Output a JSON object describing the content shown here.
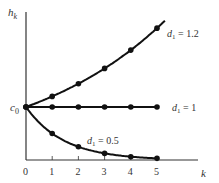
{
  "chart_data": {
    "type": "line",
    "title": "",
    "xlabel": "k",
    "ylabel": "h_k",
    "x": [
      0,
      1,
      2,
      3,
      4,
      5
    ],
    "x_tick_labels": [
      "0",
      "1",
      "2",
      "3",
      "4",
      "5"
    ],
    "y_tick_labels": [
      "c0"
    ],
    "y_reference": {
      "label": "c0",
      "value": 1
    },
    "grid": false,
    "series": [
      {
        "name": "d1 = 1.2",
        "values": [
          1,
          1.2,
          1.44,
          1.728,
          2.074,
          2.488
        ]
      },
      {
        "name": "d1 = 1",
        "values": [
          1,
          1,
          1,
          1,
          1,
          1
        ]
      },
      {
        "name": "d1 = 0.5",
        "values": [
          1,
          0.5,
          0.25,
          0.125,
          0.0625,
          0.03125
        ]
      }
    ],
    "annotations": [
      "d1 = 1.2",
      "d1 = 1",
      "d1 = 0.5"
    ]
  },
  "labels": {
    "y_axis": "h",
    "y_axis_sub": "k",
    "x_axis": "k",
    "c0": "c",
    "c0_sub": "0",
    "ticks": [
      "0",
      "1",
      "2",
      "3",
      "4",
      "5"
    ],
    "series": [
      {
        "d": "d",
        "sub": "1",
        "eq": " = 1.2"
      },
      {
        "d": "d",
        "sub": "1",
        "eq": " = 1"
      },
      {
        "d": "d",
        "sub": "1",
        "eq": " = 0.5"
      }
    ]
  }
}
